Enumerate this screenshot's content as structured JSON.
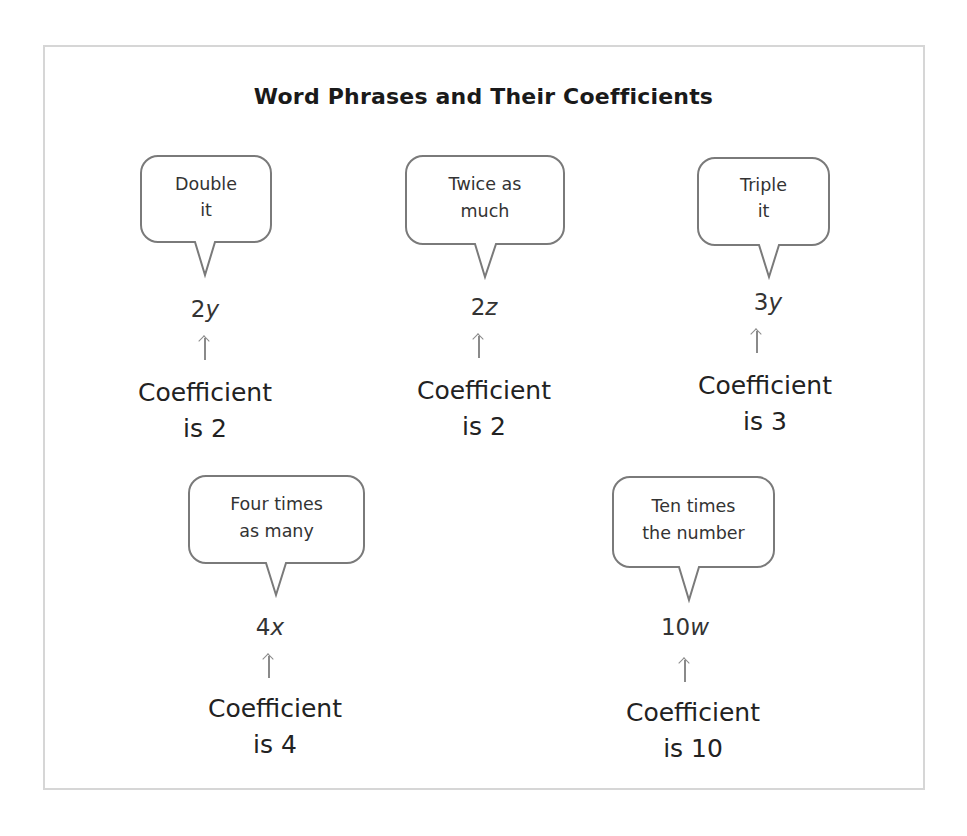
{
  "title": "Word Phrases and Their Coefficients",
  "items": [
    {
      "phrase_line1": "Double",
      "phrase_line2": "it",
      "coefficient": "2",
      "variable": "y",
      "label_line1": "Coefficient",
      "label_line2": "is 2"
    },
    {
      "phrase_line1": "Twice as",
      "phrase_line2": "much",
      "coefficient": "2",
      "variable": "z",
      "label_line1": "Coefficient",
      "label_line2": "is 2"
    },
    {
      "phrase_line1": "Triple",
      "phrase_line2": "it",
      "coefficient": "3",
      "variable": "y",
      "label_line1": "Coefficient",
      "label_line2": "is 3"
    },
    {
      "phrase_line1": "Four times",
      "phrase_line2": "as many",
      "coefficient": "4",
      "variable": "x",
      "label_line1": "Coefficient",
      "label_line2": "is 4"
    },
    {
      "phrase_line1": "Ten times",
      "phrase_line2": "the number",
      "coefficient": "10",
      "variable": "w",
      "label_line1": "Coefficient",
      "label_line2": "is 10"
    }
  ],
  "colors": {
    "frame_border": "#d6d6d6",
    "bubble_border": "#7a7a7a",
    "arrow": "#8a8a8a",
    "text": "#222222"
  }
}
